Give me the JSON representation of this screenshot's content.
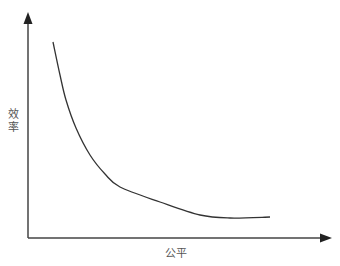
{
  "chart_data": {
    "type": "line",
    "title": "",
    "xlabel": "公平",
    "ylabel": "效率",
    "grid": false,
    "legend": null,
    "series": [
      {
        "name": "efficiency-fairness curve",
        "points": [
          [
            53,
            42
          ],
          [
            60,
            75
          ],
          [
            66,
            100
          ],
          [
            76,
            128
          ],
          [
            90,
            155
          ],
          [
            105,
            174
          ],
          [
            120,
            187
          ],
          [
            160,
            202
          ],
          [
            200,
            215
          ],
          [
            230,
            218
          ],
          [
            270,
            217
          ]
        ]
      }
    ],
    "colors": {
      "axis": "#333333",
      "curve": "#333333",
      "label": "#555555"
    }
  },
  "labels": {
    "x_axis": "公平",
    "y_axis_chars": [
      "效",
      "率"
    ]
  }
}
